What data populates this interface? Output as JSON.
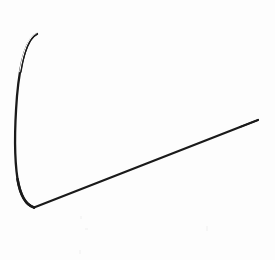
{
  "figure": {
    "title": "Hand-drawn angular line figure",
    "type": "line-drawing",
    "background_color": "#fdfdfd",
    "ink_color": "#1a1a1a",
    "canvas": {
      "width": 275,
      "height": 260
    },
    "strokes": [
      {
        "name": "curved-arc-stroke",
        "description": "Tapered arc sweeping from an upper tip down and left, bulging leftward, then hooking right to the bottom vertex",
        "start_point": [
          37,
          34
        ],
        "end_point": [
          34,
          207
        ],
        "leftmost_x": 15,
        "path": "M 37 34 C 27 38, 20 62, 17 96 C 14.5 128, 14 156, 17.5 179 C 20.5 197, 26 205, 34 207.5",
        "stroke_width_start": 1.1,
        "stroke_width_max": 2.4,
        "stroke_color": "#1a1a1a"
      },
      {
        "name": "straight-diagonal-stroke",
        "description": "Straight line rising from the bottom vertex up to the right edge",
        "start_point": [
          34,
          207
        ],
        "end_point": [
          258,
          120
        ],
        "path": "M 34 207.5 L 258 120",
        "stroke_width": 2.2,
        "stroke_color": "#1a1a1a"
      }
    ],
    "vertex": {
      "name": "bottom-vertex",
      "point": [
        34,
        207
      ],
      "description": "Junction where the arc meets the straight diagonal"
    }
  }
}
